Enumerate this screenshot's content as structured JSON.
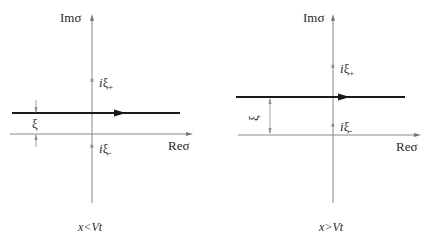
{
  "panels": [
    {
      "id": "left",
      "axes": {
        "imag_label": "Imσ",
        "real_label": "Reσ"
      },
      "poles": [
        {
          "label_i": "i",
          "label_xi": "ξ",
          "label_sub": "+",
          "position": "above-contour"
        },
        {
          "label_i": "i",
          "label_xi": "ξ",
          "label_sub": "-",
          "position": "below-real-axis"
        }
      ],
      "contour": {
        "direction": "left-to-right",
        "offset_label": "ξ",
        "relative_to_real_axis": "above"
      },
      "caption": "x<Vt"
    },
    {
      "id": "right",
      "axes": {
        "imag_label": "Imσ",
        "real_label": "Reσ"
      },
      "poles": [
        {
          "label_i": "i",
          "label_xi": "ξ",
          "label_sub": "+",
          "position": "above-contour"
        },
        {
          "label_i": "i",
          "label_xi": "ξ",
          "label_sub": "-",
          "position": "between-contour-and-real-axis"
        }
      ],
      "contour": {
        "direction": "left-to-right",
        "offset_label": "ξ",
        "relative_to_real_axis": "above"
      },
      "caption": "x>Vt"
    }
  ],
  "colors": {
    "axis": "#8a8a8a",
    "contour": "#1a1a1a",
    "text": "#2a2a2a"
  }
}
